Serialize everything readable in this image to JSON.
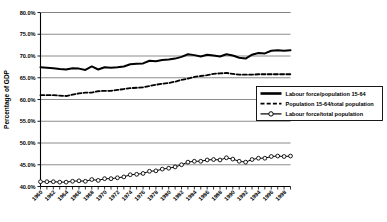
{
  "chart_data": {
    "type": "line",
    "title": "",
    "xlabel": "",
    "ylabel": "Percentage of GDP",
    "ylim": [
      40.0,
      80.0
    ],
    "ytick_labels": [
      "80.0%",
      "75.0%",
      "70.0%",
      "65.0%",
      "60.0%",
      "55.0%",
      "50.0%",
      "45.0%",
      "40.0%"
    ],
    "ytick_values": [
      80.0,
      75.0,
      70.0,
      65.0,
      60.0,
      55.0,
      50.0,
      45.0,
      40.0
    ],
    "grid": true,
    "legend_position": "center-right",
    "x": [
      1960,
      1961,
      1962,
      1963,
      1964,
      1965,
      1966,
      1967,
      1968,
      1969,
      1970,
      1971,
      1972,
      1973,
      1974,
      1975,
      1976,
      1977,
      1978,
      1979,
      1980,
      1981,
      1982,
      1983,
      1984,
      1985,
      1986,
      1987,
      1988,
      1989,
      1990,
      1991,
      1992,
      1993,
      1994,
      1995,
      1996,
      1997,
      1998,
      1999
    ],
    "xtick_labels": [
      "1960",
      "1962",
      "1964",
      "1966",
      "1968",
      "1970",
      "1972",
      "1974",
      "1976",
      "1978",
      "1980",
      "1982",
      "1984",
      "1986",
      "1988",
      "1990",
      "1992",
      "1994",
      "1996",
      "1998"
    ],
    "xtick_step": 2,
    "series": [
      {
        "name": "Labour force/population 15-64",
        "style": "solid-thick",
        "marker": "none",
        "color": "#000000",
        "values": [
          67.4,
          67.3,
          67.2,
          67.0,
          66.9,
          67.2,
          67.1,
          66.8,
          67.6,
          66.9,
          67.4,
          67.3,
          67.4,
          67.6,
          68.1,
          68.2,
          68.3,
          68.9,
          68.8,
          69.1,
          69.2,
          69.4,
          69.8,
          70.4,
          70.2,
          69.9,
          70.3,
          70.1,
          69.9,
          70.4,
          70.1,
          69.6,
          69.4,
          70.3,
          70.7,
          70.6,
          71.2,
          71.3,
          71.2,
          71.3
        ]
      },
      {
        "name": "Population 15-64/total population",
        "style": "dashed",
        "marker": "none",
        "color": "#000000",
        "values": [
          61.0,
          61.0,
          61.0,
          60.9,
          60.8,
          61.1,
          61.4,
          61.6,
          61.6,
          61.9,
          62.0,
          62.0,
          62.2,
          62.4,
          62.6,
          62.7,
          62.8,
          63.1,
          63.4,
          63.6,
          63.8,
          64.1,
          64.5,
          64.8,
          65.2,
          65.4,
          65.6,
          65.9,
          66.0,
          66.1,
          65.9,
          65.7,
          65.7,
          65.7,
          65.8,
          65.8,
          65.8,
          65.8,
          65.8,
          65.8
        ]
      },
      {
        "name": "Labour force/total population",
        "style": "solid-marker",
        "marker": "circle",
        "color": "#000000",
        "values": [
          41.1,
          41.1,
          41.1,
          41.0,
          41.0,
          41.2,
          41.3,
          41.2,
          41.6,
          41.4,
          41.8,
          41.8,
          42.0,
          42.2,
          42.7,
          42.8,
          43.0,
          43.5,
          43.6,
          44.0,
          44.2,
          44.5,
          45.0,
          45.6,
          45.8,
          45.8,
          46.1,
          46.2,
          46.1,
          46.6,
          46.3,
          45.8,
          45.6,
          46.2,
          46.5,
          46.5,
          46.9,
          47.0,
          46.9,
          47.0
        ]
      }
    ]
  }
}
